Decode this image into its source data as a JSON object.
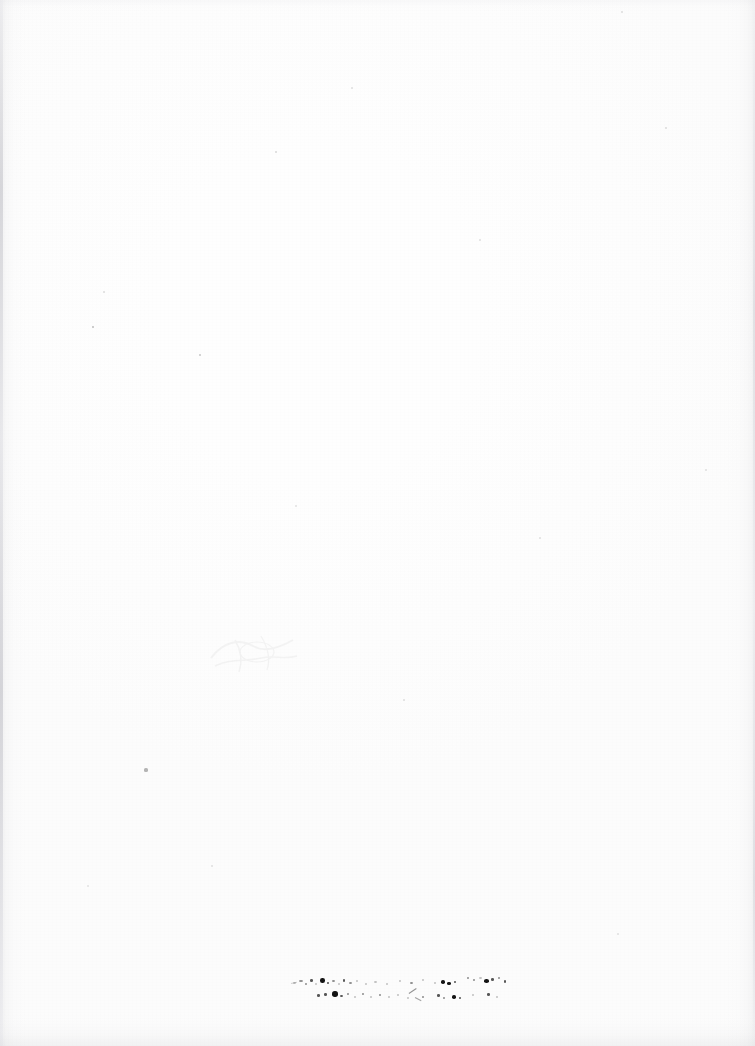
{
  "document": {
    "kind": "scanned-page",
    "page_label": "",
    "width": 755,
    "height": 1046,
    "background_color": "#fefefe",
    "paper_color": "#ffffff",
    "body_text": "",
    "header_text": "",
    "footer_text": "",
    "description": "Blank scanned page with scanner edge shading and a faded, illegible two-line ink fragment near the bottom center."
  },
  "artifacts": {
    "ink_color": "#141414",
    "speck_color": "#2a2a2a",
    "edge_shadow_color": "#c8c8cd",
    "showthrough_color": "#9a9aa0",
    "edge_left_label": "scanner-gutter-shadow",
    "edge_right_label": "scanner-edge-shadow",
    "edge_bottom_label": "scanner-bottom-band",
    "showthrough_label": "reverse-page-bleed",
    "fragment_label": "degraded-text-fragment",
    "fragment_text": ""
  },
  "specks": [
    {
      "x": 93,
      "y": 327,
      "r": 1.4,
      "o": 0.3
    },
    {
      "x": 200,
      "y": 355,
      "r": 1.2,
      "o": 0.26
    },
    {
      "x": 146,
      "y": 770,
      "r": 1.6,
      "o": 0.34
    },
    {
      "x": 276,
      "y": 152,
      "r": 1.0,
      "o": 0.18
    },
    {
      "x": 666,
      "y": 128,
      "r": 1.0,
      "o": 0.16
    },
    {
      "x": 480,
      "y": 240,
      "r": 0.9,
      "o": 0.14
    },
    {
      "x": 622,
      "y": 12,
      "r": 1.0,
      "o": 0.15
    },
    {
      "x": 352,
      "y": 88,
      "r": 0.8,
      "o": 0.13
    },
    {
      "x": 104,
      "y": 292,
      "r": 0.8,
      "o": 0.14
    },
    {
      "x": 540,
      "y": 538,
      "r": 0.9,
      "o": 0.13
    },
    {
      "x": 296,
      "y": 506,
      "r": 0.8,
      "o": 0.12
    },
    {
      "x": 404,
      "y": 700,
      "r": 0.9,
      "o": 0.14
    },
    {
      "x": 212,
      "y": 866,
      "r": 0.8,
      "o": 0.12
    },
    {
      "x": 88,
      "y": 886,
      "r": 0.8,
      "o": 0.11
    },
    {
      "x": 706,
      "y": 470,
      "r": 0.9,
      "o": 0.13
    },
    {
      "x": 618,
      "y": 934,
      "r": 0.8,
      "o": 0.12
    }
  ],
  "ink_fragment_dots": [
    {
      "x": 2,
      "y": 8,
      "w": 3,
      "h": 2,
      "c": "pale"
    },
    {
      "x": 8,
      "y": 6,
      "w": 4,
      "h": 2,
      "c": "faint"
    },
    {
      "x": 14,
      "y": 9,
      "w": 2,
      "h": 2,
      "c": "faint"
    },
    {
      "x": 19,
      "y": 5,
      "w": 3,
      "h": 3,
      "c": "mid"
    },
    {
      "x": 24,
      "y": 9,
      "w": 2,
      "h": 2,
      "c": "pale"
    },
    {
      "x": 29,
      "y": 4,
      "w": 5,
      "h": 5,
      "c": "dark"
    },
    {
      "x": 36,
      "y": 8,
      "w": 2,
      "h": 2,
      "c": "mid"
    },
    {
      "x": 41,
      "y": 6,
      "w": 3,
      "h": 2,
      "c": "faint"
    },
    {
      "x": 47,
      "y": 9,
      "w": 2,
      "h": 2,
      "c": "pale"
    },
    {
      "x": 52,
      "y": 5,
      "w": 2,
      "h": 3,
      "c": "mid"
    },
    {
      "x": 58,
      "y": 8,
      "w": 3,
      "h": 2,
      "c": "faint"
    },
    {
      "x": 65,
      "y": 6,
      "w": 2,
      "h": 2,
      "c": "pale"
    },
    {
      "x": 74,
      "y": 9,
      "w": 2,
      "h": 2,
      "c": "pale"
    },
    {
      "x": 83,
      "y": 7,
      "w": 3,
      "h": 2,
      "c": "pale"
    },
    {
      "x": 95,
      "y": 9,
      "w": 2,
      "h": 2,
      "c": "pale"
    },
    {
      "x": 108,
      "y": 6,
      "w": 2,
      "h": 2,
      "c": "pale"
    },
    {
      "x": 119,
      "y": 8,
      "w": 3,
      "h": 2,
      "c": "faint"
    },
    {
      "x": 131,
      "y": 5,
      "w": 2,
      "h": 2,
      "c": "pale"
    },
    {
      "x": 143,
      "y": 8,
      "w": 2,
      "h": 2,
      "c": "pale"
    },
    {
      "x": 150,
      "y": 6,
      "w": 4,
      "h": 4,
      "c": "dark"
    },
    {
      "x": 156,
      "y": 8,
      "w": 4,
      "h": 3,
      "c": "dark"
    },
    {
      "x": 163,
      "y": 7,
      "w": 2,
      "h": 2,
      "c": "mid"
    },
    {
      "x": 176,
      "y": 3,
      "w": 2,
      "h": 2,
      "c": "faint"
    },
    {
      "x": 182,
      "y": 5,
      "w": 2,
      "h": 2,
      "c": "faint"
    },
    {
      "x": 188,
      "y": 3,
      "w": 3,
      "h": 2,
      "c": "pale"
    },
    {
      "x": 193,
      "y": 5,
      "w": 5,
      "h": 4,
      "c": "dark"
    },
    {
      "x": 200,
      "y": 4,
      "w": 3,
      "h": 3,
      "c": "mid"
    },
    {
      "x": 207,
      "y": 3,
      "w": 2,
      "h": 2,
      "c": "faint"
    },
    {
      "x": 213,
      "y": 6,
      "w": 2,
      "h": 3,
      "c": "mid"
    },
    {
      "x": 26,
      "y": 20,
      "w": 3,
      "h": 3,
      "c": "mid"
    },
    {
      "x": 33,
      "y": 19,
      "w": 3,
      "h": 3,
      "c": "mid"
    },
    {
      "x": 41,
      "y": 17,
      "w": 6,
      "h": 6,
      "c": "dark"
    },
    {
      "x": 49,
      "y": 21,
      "w": 3,
      "h": 2,
      "c": "mid"
    },
    {
      "x": 56,
      "y": 19,
      "w": 2,
      "h": 2,
      "c": "faint"
    },
    {
      "x": 63,
      "y": 22,
      "w": 2,
      "h": 2,
      "c": "pale"
    },
    {
      "x": 71,
      "y": 19,
      "w": 2,
      "h": 2,
      "c": "faint"
    },
    {
      "x": 79,
      "y": 22,
      "w": 2,
      "h": 2,
      "c": "pale"
    },
    {
      "x": 88,
      "y": 20,
      "w": 2,
      "h": 2,
      "c": "faint"
    },
    {
      "x": 97,
      "y": 22,
      "w": 2,
      "h": 2,
      "c": "pale"
    },
    {
      "x": 106,
      "y": 20,
      "w": 2,
      "h": 2,
      "c": "pale"
    },
    {
      "x": 116,
      "y": 23,
      "w": 2,
      "h": 2,
      "c": "pale"
    },
    {
      "x": 131,
      "y": 22,
      "w": 2,
      "h": 2,
      "c": "faint"
    },
    {
      "x": 146,
      "y": 20,
      "w": 3,
      "h": 3,
      "c": "mid"
    },
    {
      "x": 152,
      "y": 23,
      "w": 2,
      "h": 2,
      "c": "faint"
    },
    {
      "x": 161,
      "y": 21,
      "w": 4,
      "h": 4,
      "c": "dark"
    },
    {
      "x": 168,
      "y": 23,
      "w": 2,
      "h": 2,
      "c": "mid"
    },
    {
      "x": 181,
      "y": 20,
      "w": 2,
      "h": 2,
      "c": "pale"
    },
    {
      "x": 196,
      "y": 19,
      "w": 3,
      "h": 3,
      "c": "mid"
    },
    {
      "x": 205,
      "y": 22,
      "w": 2,
      "h": 2,
      "c": "pale"
    }
  ],
  "ink_fragment_strokes": [
    {
      "x": 118,
      "y": 19,
      "w": 9,
      "h": 1.4,
      "rot": -34,
      "o": 0.55
    },
    {
      "x": 124,
      "y": 23,
      "w": 7,
      "h": 1.2,
      "rot": 28,
      "o": 0.45
    },
    {
      "x": 0,
      "y": 9,
      "w": 6,
      "h": 1.0,
      "rot": -12,
      "o": 0.22
    }
  ]
}
